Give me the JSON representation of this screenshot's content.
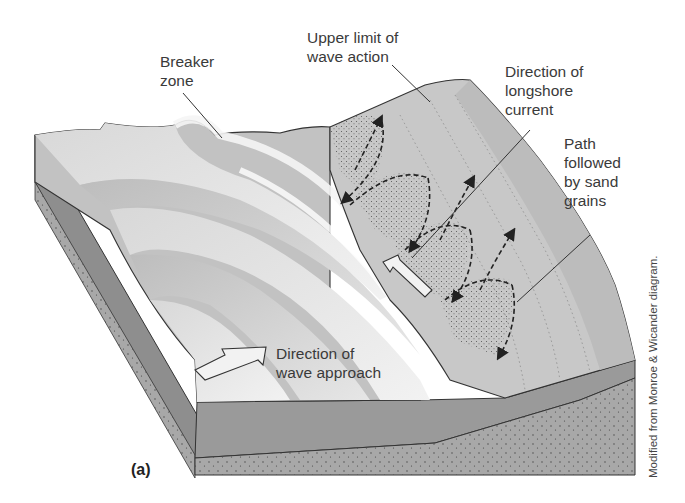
{
  "figure": {
    "panel_label": "(a)",
    "credit": "Modified from Monroe & Wicander diagram.",
    "labels": {
      "breaker_zone": "Breaker\nzone",
      "upper_limit": "Upper limit of\nwave action",
      "longshore_current": "Direction of\nlongshore\ncurrent",
      "sand_path": "Path\nfollowed\nby sand\ngrains",
      "wave_approach": "Direction of\nwave approach"
    },
    "colors": {
      "block_side": "#8e8e8e",
      "block_front": "#9a9a9a",
      "sand_layer": "#a8a8a8",
      "beach": "#c4c4c4",
      "wave_light": "#e8e8e8",
      "wave_dark": "#b0b0b0",
      "outline": "#333333"
    }
  }
}
